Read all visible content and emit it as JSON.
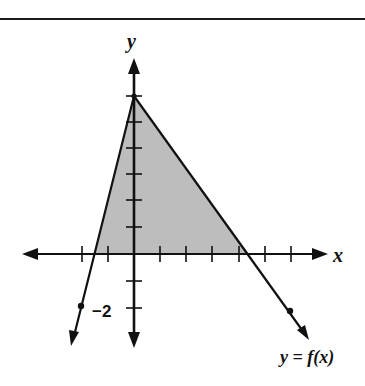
{
  "figure": {
    "axis_labels": {
      "x": "x",
      "y": "y"
    },
    "tick_label": "−2",
    "function_label": "y = f(x)",
    "colors": {
      "shade": "#bdbdbd",
      "ink": "#111111",
      "background": "#ffffff"
    }
  },
  "diagram": {
    "type": "function-graph",
    "apex": [
      0,
      6
    ],
    "x_intercepts": [
      -1.5,
      4.5
    ],
    "marked_points": [
      [
        -2,
        -2
      ],
      [
        6,
        -2
      ]
    ],
    "ticks_x": [
      -2,
      -1,
      1,
      2,
      3,
      4,
      5,
      6
    ],
    "ticks_y": [
      -2,
      -1,
      1,
      2,
      3,
      4,
      5,
      6
    ]
  }
}
